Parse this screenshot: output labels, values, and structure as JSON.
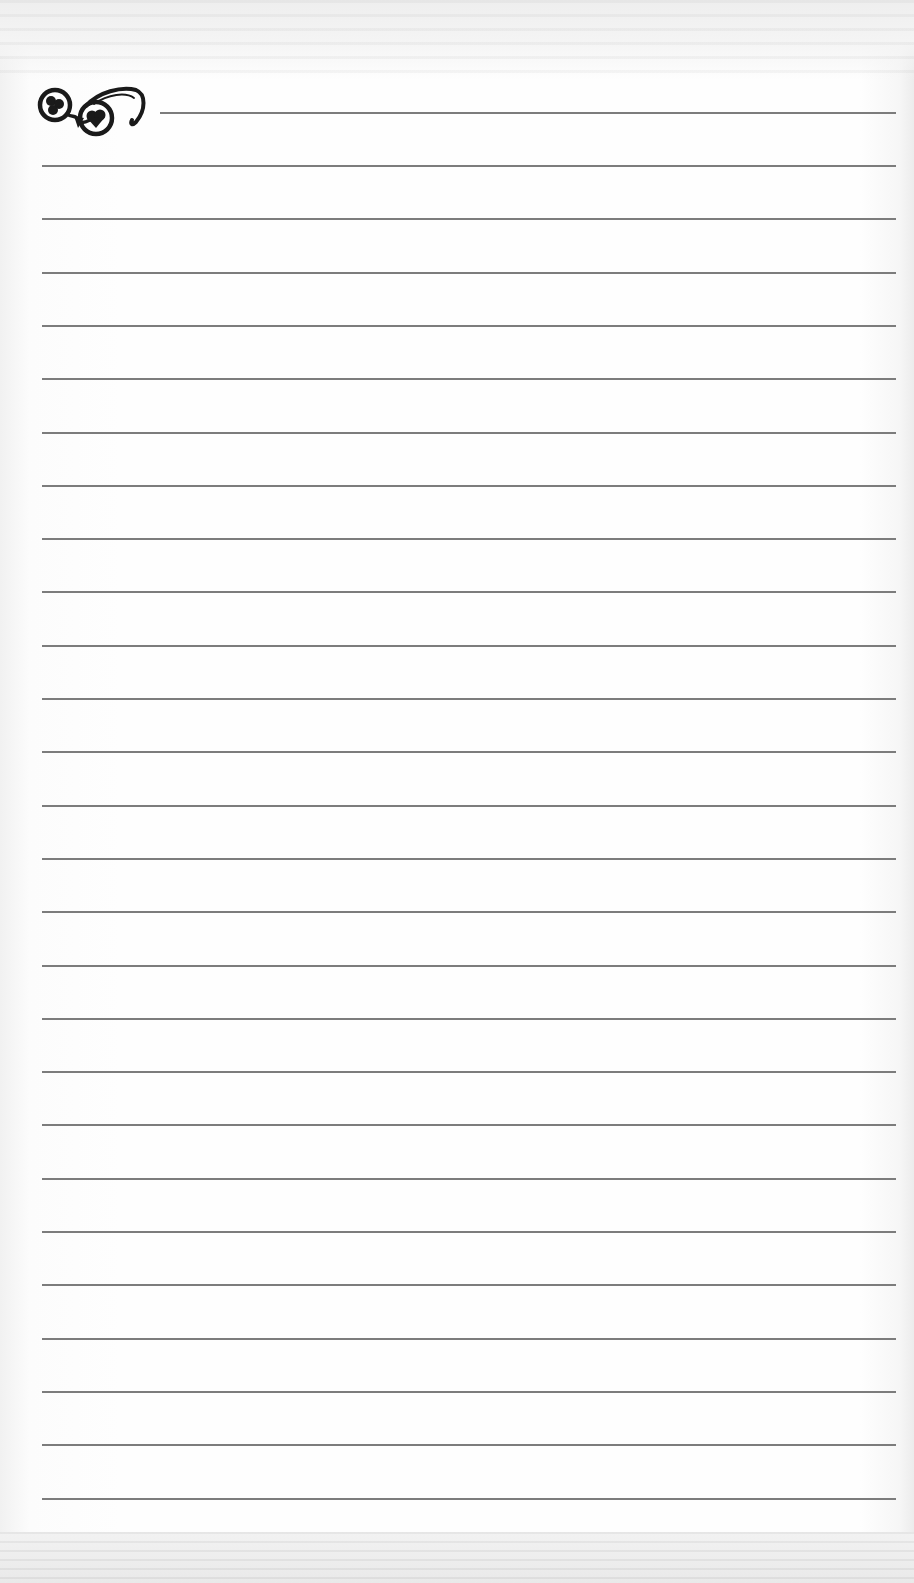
{
  "page": {
    "type": "ruled-notebook-page",
    "background_color": "#fdfdfd",
    "line_color": "#6e6e6e",
    "ornament": {
      "icon": "flourish-scroll-icon",
      "color": "#1a1a1a",
      "position": "top-left"
    },
    "header_line": {
      "y": 112,
      "x_start": 160,
      "x_end": 896
    },
    "ruled_lines": {
      "count": 26,
      "x_start": 42,
      "x_end": 896,
      "first_y": 165,
      "spacing": 53.3
    }
  }
}
